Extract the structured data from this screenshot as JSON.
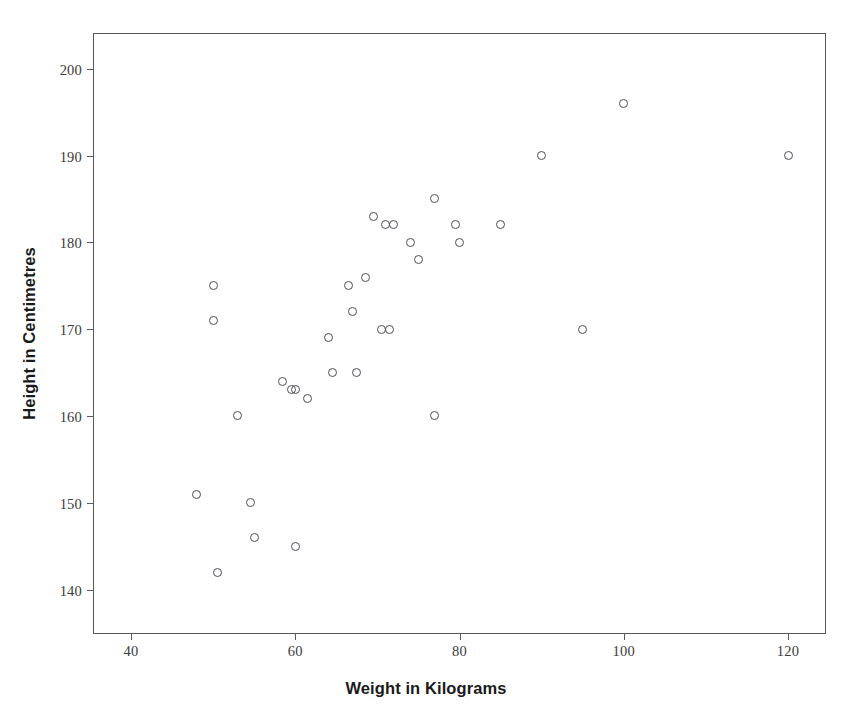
{
  "chart_data": {
    "type": "scatter",
    "title": "",
    "xlabel": "Weight in Kilograms",
    "ylabel": "Height in Centimetres",
    "xlim": [
      35.5,
      124.5
    ],
    "ylim": [
      135.0,
      204.0
    ],
    "xticks": [
      40,
      60,
      80,
      100,
      120
    ],
    "yticks": [
      140,
      150,
      160,
      170,
      180,
      190,
      200
    ],
    "grid": false,
    "legend": null,
    "marker": {
      "shape": "open-circle",
      "edge_color": "#4d4d55",
      "fill": "none",
      "size_px": 9
    },
    "frame_color": "#595959",
    "background": "#ffffff",
    "n_points": 34,
    "points": [
      {
        "x": 48,
        "y": 151
      },
      {
        "x": 50,
        "y": 175
      },
      {
        "x": 50,
        "y": 171
      },
      {
        "x": 50.5,
        "y": 142
      },
      {
        "x": 53,
        "y": 160
      },
      {
        "x": 54.5,
        "y": 150
      },
      {
        "x": 55,
        "y": 146
      },
      {
        "x": 58.5,
        "y": 164
      },
      {
        "x": 59.5,
        "y": 163
      },
      {
        "x": 60,
        "y": 163
      },
      {
        "x": 60,
        "y": 145
      },
      {
        "x": 61.5,
        "y": 162
      },
      {
        "x": 64,
        "y": 169
      },
      {
        "x": 64.5,
        "y": 165
      },
      {
        "x": 66.5,
        "y": 175
      },
      {
        "x": 67,
        "y": 172
      },
      {
        "x": 67.5,
        "y": 165
      },
      {
        "x": 68.5,
        "y": 176
      },
      {
        "x": 69.5,
        "y": 183
      },
      {
        "x": 70.5,
        "y": 170
      },
      {
        "x": 71.5,
        "y": 170
      },
      {
        "x": 71,
        "y": 182
      },
      {
        "x": 72,
        "y": 182
      },
      {
        "x": 74,
        "y": 180
      },
      {
        "x": 75,
        "y": 178
      },
      {
        "x": 77,
        "y": 185
      },
      {
        "x": 77,
        "y": 160
      },
      {
        "x": 79.5,
        "y": 182
      },
      {
        "x": 80,
        "y": 180
      },
      {
        "x": 85,
        "y": 182
      },
      {
        "x": 90,
        "y": 190
      },
      {
        "x": 95,
        "y": 170
      },
      {
        "x": 100,
        "y": 196
      },
      {
        "x": 120,
        "y": 190
      }
    ]
  }
}
